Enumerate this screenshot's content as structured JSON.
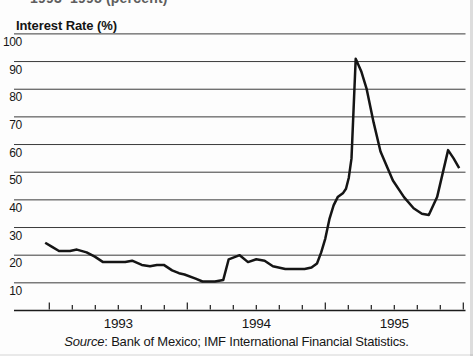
{
  "page": {
    "truncated_heading": "1993–1995 (percent)"
  },
  "chart": {
    "axis_title": "Interest Rate (%)",
    "year_labels": [
      "1993",
      "1994",
      "1995"
    ],
    "source_prefix": "Source",
    "source_rest": ": Bank of Mexico; IMF International Financial Statistics."
  },
  "chart_data": {
    "type": "line",
    "title": "Interest Rate (%)",
    "ylabel": "Interest Rate (%)",
    "xlabel": "",
    "ylim": [
      0,
      100
    ],
    "yticks": [
      100,
      90,
      80,
      70,
      60,
      50,
      40,
      30,
      20,
      10
    ],
    "x_unit": "decimal_year",
    "x_range": [
      1992.74,
      1996.0
    ],
    "xticks_major_years": [
      1993,
      1994,
      1995,
      1996
    ],
    "xtick_minor_interval_months": 2,
    "grid": "horizontal",
    "legend": "none",
    "line_color": "#151515",
    "series": [
      {
        "name": "Mexico interest rate (%)",
        "points": [
          [
            1992.97,
            24.5
          ],
          [
            1993.02,
            23
          ],
          [
            1993.07,
            21.5
          ],
          [
            1993.15,
            21.5
          ],
          [
            1993.2,
            22
          ],
          [
            1993.27,
            21
          ],
          [
            1993.33,
            19.5
          ],
          [
            1993.39,
            17.5
          ],
          [
            1993.48,
            17.5
          ],
          [
            1993.55,
            17.5
          ],
          [
            1993.6,
            18
          ],
          [
            1993.67,
            16.5
          ],
          [
            1993.73,
            16
          ],
          [
            1993.78,
            16.5
          ],
          [
            1993.83,
            16.5
          ],
          [
            1993.89,
            14.5
          ],
          [
            1993.94,
            13.5
          ],
          [
            1993.98,
            13
          ],
          [
            1994.06,
            11.5
          ],
          [
            1994.11,
            10.5
          ],
          [
            1994.2,
            10.5
          ],
          [
            1994.26,
            11
          ],
          [
            1994.3,
            18.5
          ],
          [
            1994.38,
            20
          ],
          [
            1994.44,
            17.5
          ],
          [
            1994.5,
            18.5
          ],
          [
            1994.56,
            18
          ],
          [
            1994.62,
            16
          ],
          [
            1994.71,
            15
          ],
          [
            1994.78,
            15
          ],
          [
            1994.85,
            15
          ],
          [
            1994.9,
            15.5
          ],
          [
            1994.94,
            17
          ],
          [
            1994.97,
            21
          ],
          [
            1995.0,
            26
          ],
          [
            1995.03,
            33
          ],
          [
            1995.06,
            38
          ],
          [
            1995.09,
            41
          ],
          [
            1995.13,
            42.5
          ],
          [
            1995.15,
            44
          ],
          [
            1995.17,
            48
          ],
          [
            1995.19,
            55
          ],
          [
            1995.22,
            91
          ],
          [
            1995.26,
            86.5
          ],
          [
            1995.3,
            80
          ],
          [
            1995.35,
            68
          ],
          [
            1995.4,
            57.5
          ],
          [
            1995.49,
            47
          ],
          [
            1995.57,
            41
          ],
          [
            1995.64,
            37
          ],
          [
            1995.7,
            35
          ],
          [
            1995.75,
            34.5
          ],
          [
            1995.81,
            41
          ],
          [
            1995.89,
            58
          ],
          [
            1995.93,
            55
          ],
          [
            1995.97,
            51.5
          ]
        ]
      }
    ]
  }
}
